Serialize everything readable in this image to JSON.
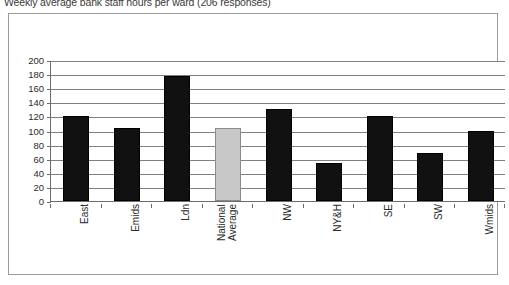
{
  "chart_data": {
    "type": "bar",
    "title": "Weekly average bank staff hours per ward (206 responses)",
    "xlabel": "",
    "ylabel": "",
    "ylim": [
      0,
      200
    ],
    "ytick_step": 20,
    "grid": true,
    "legend": "none",
    "categories": [
      "East",
      "Emids",
      "Ldn",
      "National Average",
      "NW",
      "NY&H",
      "SE",
      "SW",
      "Wmids"
    ],
    "values": [
      120,
      103,
      177,
      103,
      130,
      54,
      120,
      68,
      100
    ],
    "ytick_labels": [
      "200",
      "180",
      "160",
      "140",
      "120",
      "100",
      "80",
      "60",
      "40",
      "20",
      "0"
    ],
    "series": [
      {
        "name": "Weekly average bank staff hours per ward",
        "values": [
          120,
          103,
          177,
          103,
          130,
          54,
          120,
          68,
          100
        ]
      }
    ],
    "highlight_category": "National Average",
    "colors": {
      "bar": "#111111",
      "bar_highlight": "#c8c8c8",
      "axis": "#6d6d6d",
      "gridline": "#808080",
      "frame": "#9b9b9b",
      "text": "#2b2b2b",
      "background": "#ffffff"
    }
  }
}
